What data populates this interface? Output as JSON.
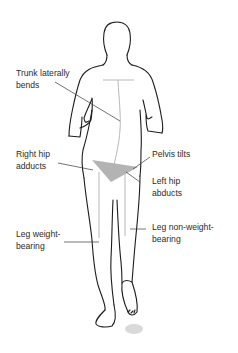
{
  "diagram": {
    "colors": {
      "outline": "#1c1c1c",
      "guide_lines": "#b8b8b8",
      "pelvis_fill": "#b3b3b3",
      "leader_lines": "#3a3a3a",
      "text": "#2b2b2b",
      "shadow": "#cfcfcf"
    },
    "labels": {
      "trunk": "Trunk laterally\nbends",
      "right_hip": "Right hip\nadducts",
      "pelvis": "Pelvis tilts",
      "left_hip": "Left hip\nabducts",
      "leg_weight": "Leg weight-\nbearing",
      "leg_nonweight": "Leg non-weight-\nbearing"
    }
  }
}
